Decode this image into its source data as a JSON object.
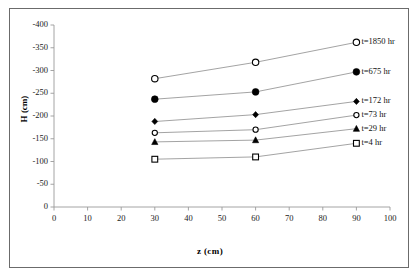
{
  "chart_data": {
    "type": "line",
    "title": "",
    "xlabel": "z (cm)",
    "ylabel": "H (cm)",
    "x": [
      30,
      60,
      90
    ],
    "xlim": [
      0,
      100
    ],
    "ylim": [
      -400,
      0
    ],
    "xticks": [
      0,
      10,
      20,
      30,
      40,
      50,
      60,
      70,
      80,
      90,
      100
    ],
    "yticks": [
      -400,
      -350,
      -300,
      -250,
      -200,
      -150,
      -100,
      -50,
      0
    ],
    "ytick_labels": [
      "-400",
      "-350",
      "-300",
      "-250",
      "-200",
      "-150",
      "-100",
      "-50",
      "0"
    ],
    "xtick_labels": [
      "0",
      "10",
      "20",
      "30",
      "40",
      "50",
      "60",
      "70",
      "80",
      "90",
      "100"
    ],
    "y_axis_inverted": true,
    "grid": false,
    "legend_position": "right-inline-at-line-end",
    "line_color": "#8c8c8c",
    "marker_color": "#000000",
    "series": [
      {
        "name": "t=1850 hr",
        "label": "t=1850 hr",
        "marker": "open-circle",
        "values": [
          -282,
          -318,
          -362
        ]
      },
      {
        "name": "t=675 hr",
        "label": "t=675 hr",
        "marker": "filled-circle",
        "values": [
          -237,
          -253,
          -297
        ]
      },
      {
        "name": "t=172 hr",
        "label": "t=172 hr",
        "marker": "filled-diamond",
        "values": [
          -188,
          -203,
          -232
        ]
      },
      {
        "name": "t=73 hr",
        "label": "t=73 hr",
        "marker": "open-circle-small",
        "values": [
          -163,
          -170,
          -202
        ]
      },
      {
        "name": "t=29 hr",
        "label": "t=29 hr",
        "marker": "filled-triangle",
        "values": [
          -143,
          -147,
          -172
        ]
      },
      {
        "name": "t=4 hr",
        "label": "t=4  hr",
        "marker": "open-square",
        "values": [
          -105,
          -110,
          -140
        ]
      }
    ]
  }
}
